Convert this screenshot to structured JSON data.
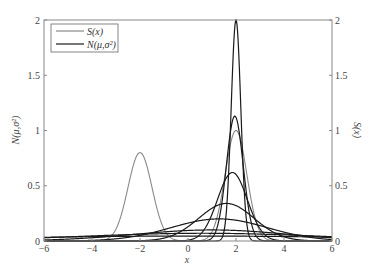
{
  "chart_data": {
    "type": "line",
    "title": "",
    "xlabel": "x",
    "ylabel_left": "N(μ,σ²)",
    "ylabel_right": "S(x)",
    "xlim": [
      -6,
      6
    ],
    "ylim_left": [
      0,
      2
    ],
    "ylim_right": [
      0,
      2
    ],
    "x_ticks": [
      "-6",
      "-4",
      "-2",
      "0",
      "2",
      "4",
      "6"
    ],
    "y_ticks_left": [
      "0",
      "0.5",
      "1",
      "1.5",
      "2"
    ],
    "y_ticks_right": [
      "0",
      "0.5",
      "1",
      "1.5",
      "2"
    ],
    "grid": false,
    "legend": {
      "position": "upper-left",
      "entries": [
        {
          "label": "S(x)",
          "color": "#8a8a8a"
        },
        {
          "label": "N(μ,σ²)",
          "color": "#1a1a1a"
        }
      ]
    },
    "target_distribution": {
      "name": "S(x)",
      "color": "#8a8a8a",
      "components": [
        {
          "mean": -2,
          "peak": 0.8,
          "sigma": 0.5
        },
        {
          "mean": 2,
          "peak": 1.0,
          "sigma": 0.45
        }
      ]
    },
    "gaussian_series": [
      {
        "mean": 0.2,
        "peak": 0.045,
        "sigma": 8.0
      },
      {
        "mean": 0.6,
        "peak": 0.07,
        "sigma": 5.0
      },
      {
        "mean": 1.0,
        "peak": 0.1,
        "sigma": 3.2
      },
      {
        "mean": 1.3,
        "peak": 0.2,
        "sigma": 2.0
      },
      {
        "mean": 1.6,
        "peak": 0.34,
        "sigma": 1.15
      },
      {
        "mean": 1.85,
        "peak": 0.62,
        "sigma": 0.62
      },
      {
        "mean": 1.95,
        "peak": 1.13,
        "sigma": 0.35
      },
      {
        "mean": 2.0,
        "peak": 2.0,
        "sigma": 0.2
      }
    ],
    "series_color": "#1a1a1a"
  }
}
